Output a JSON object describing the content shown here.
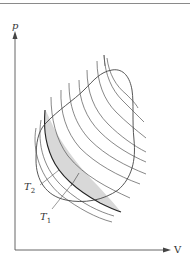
{
  "figure": {
    "type": "thermodynamic p-V diagram",
    "axes": {
      "y_label": "p",
      "x_label": "V"
    },
    "labels": {
      "t1": {
        "main": "T",
        "sub": "1"
      },
      "t2": {
        "main": "T",
        "sub": "2"
      }
    },
    "colors": {
      "line": "#444444",
      "shade": "#d8d8d8",
      "axis": "#555555"
    },
    "isotherm_count": 11
  }
}
